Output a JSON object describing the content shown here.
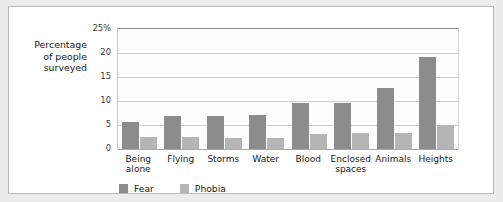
{
  "chart_data": {
    "type": "bar",
    "title": "",
    "xlabel": "",
    "ylabel": "Percentage\nof people\nsurveyed",
    "ylim": [
      0,
      25
    ],
    "yticks": [
      "25%",
      "20",
      "15",
      "10",
      "5",
      "0"
    ],
    "ytick_values": [
      25,
      20,
      15,
      10,
      5,
      0
    ],
    "grid": true,
    "legend_position": "bottom-left",
    "categories": [
      "Being\nalone",
      "Flying",
      "Storms",
      "Water",
      "Blood",
      "Enclosed\nspaces",
      "Animals",
      "Heights"
    ],
    "series": [
      {
        "name": "Fear",
        "color": "#8c8c8c",
        "values": [
          5.6,
          6.8,
          6.9,
          7.0,
          9.5,
          9.5,
          12.7,
          19.2
        ]
      },
      {
        "name": "Phobia",
        "color": "#b5b5b5",
        "values": [
          2.5,
          2.4,
          2.2,
          2.2,
          3.2,
          3.3,
          3.3,
          5.0
        ]
      }
    ]
  },
  "legend": {
    "items": [
      {
        "label": "Fear"
      },
      {
        "label": "Phobia"
      }
    ]
  },
  "colors": {
    "fear": "#8c8c8c",
    "phobia": "#b5b5b5",
    "panel_background": "#ffffff",
    "outer_background": "#ececeb",
    "gridline": "#cfcfcf",
    "text": "#1a1a1a"
  }
}
